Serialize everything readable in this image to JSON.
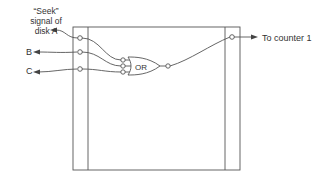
{
  "diagram": {
    "inputs": [
      {
        "id": "seek-a",
        "label_lines": [
          "“Seek”",
          "signal of",
          "disk A"
        ]
      },
      {
        "id": "b",
        "label": "B"
      },
      {
        "id": "c",
        "label": "C"
      }
    ],
    "gate": {
      "type": "OR",
      "label": "OR"
    },
    "output": {
      "label": "To counter 1"
    },
    "colors": {
      "stroke": "#555555",
      "text": "#333333",
      "background": "#ffffff"
    }
  }
}
